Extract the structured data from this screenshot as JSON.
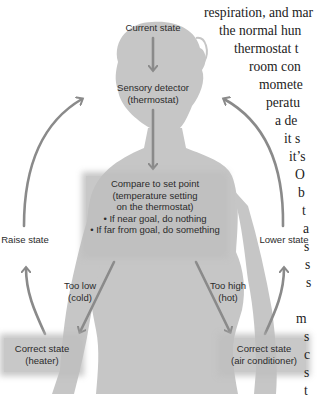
{
  "diagram": {
    "nodes": {
      "current_state": "Current state",
      "sensory_detector": [
        "Sensory detector",
        "(thermostat)"
      ],
      "compare": {
        "lines": [
          "Compare to set point",
          "(temperature setting",
          "on the thermostat)"
        ],
        "bullets": [
          "• If near goal, do nothing",
          "• If far from goal, do something"
        ]
      },
      "too_low": [
        "Too low",
        "(cold)"
      ],
      "too_high": [
        "Too high",
        "(hot)"
      ],
      "heater": [
        "Correct state",
        "(heater)"
      ],
      "air_conditioner": [
        "Correct state",
        "(air conditioner)"
      ],
      "raise_state": "Raise state",
      "lower_state": "Lower state"
    },
    "colors": {
      "silhouette": "#c4c4c4",
      "arrow": "#8a8a8a",
      "box": "#bdbdbd",
      "text": "#2b2b2b"
    }
  },
  "prose_fragments": [
    "respiration, and mar",
    "the normal hun",
    "thermostat t",
    "room con",
    "momete",
    "peratu",
    "a de",
    "it s",
    "it’s",
    "O",
    "b",
    "t",
    "a",
    "s",
    "s",
    "s",
    "",
    "m",
    "s",
    "c",
    "s",
    "t",
    "f  f"
  ]
}
